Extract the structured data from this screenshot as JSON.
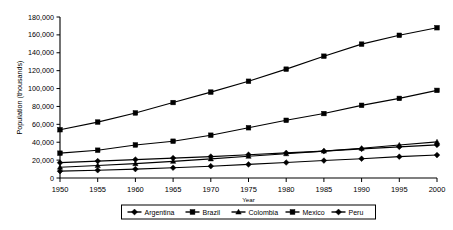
{
  "chart_data": {
    "type": "line",
    "title": "",
    "xlabel": "Year",
    "ylabel": "Population (thousands)",
    "x": [
      1950,
      1955,
      1960,
      1965,
      1970,
      1975,
      1980,
      1985,
      1990,
      1995,
      2000
    ],
    "xtick_labels": [
      "1950",
      "1955",
      "1960",
      "1965",
      "1970",
      "1975",
      "1980",
      "1985",
      "1990",
      "1995",
      "2000"
    ],
    "ytick_labels": [
      "0",
      "20,000",
      "40,000",
      "60,000",
      "80,000",
      "100,000",
      "120,000",
      "140,000",
      "160,000",
      "180,000"
    ],
    "yticks": [
      0,
      20000,
      40000,
      60000,
      80000,
      100000,
      120000,
      140000,
      160000,
      180000
    ],
    "ylim": [
      0,
      180000
    ],
    "xlim": [
      1950,
      2000
    ],
    "grid": false,
    "legend_position": "bottom",
    "series": [
      {
        "name": "Argentina",
        "marker": "diamond",
        "values": [
          17150,
          18930,
          20620,
          22280,
          23960,
          26050,
          28090,
          30090,
          32580,
          34830,
          37030
        ]
      },
      {
        "name": "Brazil",
        "marker": "square",
        "values": [
          53980,
          62530,
          72740,
          84370,
          96030,
          108160,
          121670,
          136180,
          149650,
          159540,
          168000
        ]
      },
      {
        "name": "Colombia",
        "marker": "triangle",
        "values": [
          12000,
          13920,
          16060,
          18590,
          21360,
          24310,
          27100,
          30060,
          33230,
          36860,
          40350
        ]
      },
      {
        "name": "Mexico",
        "marker": "square",
        "values": [
          27740,
          31080,
          36950,
          41120,
          47840,
          56180,
          64500,
          72050,
          81250,
          89000,
          97960
        ]
      },
      {
        "name": "Peru",
        "marker": "diamond",
        "values": [
          7630,
          8670,
          9930,
          11470,
          13190,
          15160,
          17300,
          19520,
          21570,
          23840,
          25660
        ]
      }
    ]
  }
}
